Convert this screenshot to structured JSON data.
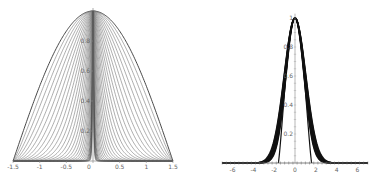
{
  "chart_data": [
    {
      "type": "line",
      "title": "",
      "xlabel": "",
      "ylabel": "",
      "xlim": [
        -1.5,
        1.5
      ],
      "ylim": [
        0,
        1
      ],
      "grid": false,
      "legend": null,
      "x_ticks": [
        "-1.5",
        "-1",
        "-0.5",
        "0",
        "0.5",
        "1",
        "1.5"
      ],
      "x_tick_values": [
        -1.5,
        -1,
        -0.5,
        0,
        0.5,
        1,
        1.5
      ],
      "y_ticks": [
        "0.2",
        "0.4",
        "0.6",
        "0.8"
      ],
      "y_tick_values": [
        0.2,
        0.4,
        0.6,
        0.8
      ],
      "description": "Family of ~30 symmetric bell curves peaking at (0,1), all vanishing at x=±1.5; outermost is cosine-like, inner curves narrow toward x≈±0.55 with flat tails",
      "family": {
        "count": 30,
        "exponent_min": 1,
        "exponent_max": 60,
        "support": 1.5
      },
      "series_samples": [
        {
          "name": "outermost",
          "x": [
            -1.5,
            -1,
            -0.5,
            0,
            0.5,
            1,
            1.5
          ],
          "y": [
            0,
            0.5,
            0.87,
            1,
            0.87,
            0.5,
            0
          ]
        },
        {
          "name": "innermost",
          "x": [
            -1.5,
            -1,
            -0.55,
            -0.3,
            0,
            0.3,
            0.55,
            1,
            1.5
          ],
          "y": [
            0,
            0.0,
            0.02,
            0.5,
            1,
            0.5,
            0.02,
            0.0,
            0
          ]
        }
      ]
    },
    {
      "type": "line",
      "title": "",
      "xlabel": "",
      "ylabel": "",
      "xlim": [
        -7,
        7
      ],
      "ylim": [
        0,
        1
      ],
      "grid": false,
      "legend": null,
      "x_ticks": [
        "-6",
        "-4",
        "-2",
        "0",
        "2",
        "4",
        "6"
      ],
      "x_tick_values": [
        -6,
        -4,
        -2,
        0,
        2,
        4,
        6
      ],
      "y_ticks": [
        "0.2",
        "0.4",
        "0.6",
        "0.8",
        "1"
      ],
      "y_tick_values": [
        0.2,
        0.4,
        0.6,
        0.8,
        1
      ],
      "description": "Bundle of thick near-Gaussian curves peaking at (0,1) with support roughly |x|<3, plus a narrow compactly supported curve reaching zero at x≈±1.6",
      "family": {
        "count": 10,
        "sigma_min": 0.85,
        "sigma_max": 1.05,
        "compact_support": 1.6
      },
      "series_samples": [
        {
          "name": "gaussian-like",
          "x": [
            -3,
            -2,
            -1,
            0,
            1,
            2,
            3
          ],
          "y": [
            0.01,
            0.13,
            0.6,
            1,
            0.6,
            0.13,
            0.01
          ]
        },
        {
          "name": "compact",
          "x": [
            -1.6,
            -1,
            0,
            1,
            1.6
          ],
          "y": [
            0,
            0.6,
            1,
            0.6,
            0
          ]
        }
      ]
    }
  ]
}
